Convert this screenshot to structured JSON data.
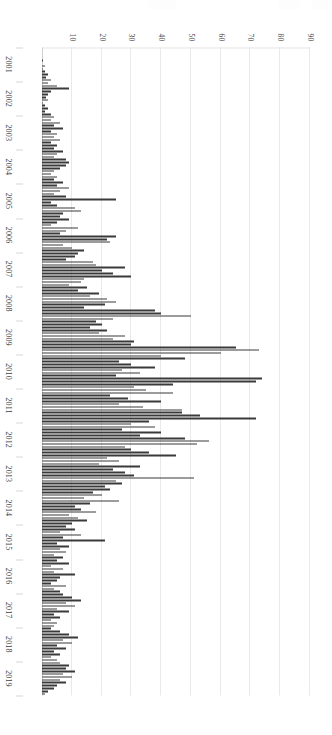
{
  "figure": {
    "orientation": "rotated-90-clockwise-on-page",
    "background_color": "#ffffff",
    "bar_color": "#3a3a3a",
    "gridline_color": "#e9e9e9",
    "axis_color": "#cfcfcf"
  },
  "chart_data": {
    "type": "bar",
    "title": "",
    "subtitle": "",
    "xlabel": "",
    "ylabel": "",
    "xlim_categories": [
      "2001",
      "2019"
    ],
    "ylim": [
      0,
      90
    ],
    "grid": true,
    "legend": null,
    "legend_position": "none",
    "y_ticks": [
      10,
      20,
      30,
      40,
      50,
      60,
      70,
      80,
      90
    ],
    "y_tick_labels": [
      "10",
      "20",
      "30",
      "40",
      "50",
      "60",
      "70",
      "80",
      "90"
    ],
    "x_tick_labels": [
      "2001",
      "2002",
      "2003",
      "2004",
      "2005",
      "2006",
      "2007",
      "2008",
      "2009",
      "2010",
      "2011",
      "2012",
      "2013",
      "2014",
      "2015",
      "2016",
      "2017",
      "2018",
      "2019"
    ],
    "bar_interval": "monthly",
    "categories": [
      "2001-01",
      "2001-02",
      "2001-03",
      "2001-04",
      "2001-05",
      "2001-06",
      "2001-07",
      "2001-08",
      "2001-09",
      "2001-10",
      "2001-11",
      "2001-12",
      "2002-01",
      "2002-02",
      "2002-03",
      "2002-04",
      "2002-05",
      "2002-06",
      "2002-07",
      "2002-08",
      "2002-09",
      "2002-10",
      "2002-11",
      "2002-12",
      "2003-01",
      "2003-02",
      "2003-03",
      "2003-04",
      "2003-05",
      "2003-06",
      "2003-07",
      "2003-08",
      "2003-09",
      "2003-10",
      "2003-11",
      "2003-12",
      "2004-01",
      "2004-02",
      "2004-03",
      "2004-04",
      "2004-05",
      "2004-06",
      "2004-07",
      "2004-08",
      "2004-09",
      "2004-10",
      "2004-11",
      "2004-12",
      "2005-01",
      "2005-02",
      "2005-03",
      "2005-04",
      "2005-05",
      "2005-06",
      "2005-07",
      "2005-08",
      "2005-09",
      "2005-10",
      "2005-11",
      "2005-12",
      "2006-01",
      "2006-02",
      "2006-03",
      "2006-04",
      "2006-05",
      "2006-06",
      "2006-07",
      "2006-08",
      "2006-09",
      "2006-10",
      "2006-11",
      "2006-12",
      "2007-01",
      "2007-02",
      "2007-03",
      "2007-04",
      "2007-05",
      "2007-06",
      "2007-07",
      "2007-08",
      "2007-09",
      "2007-10",
      "2007-11",
      "2007-12",
      "2008-01",
      "2008-02",
      "2008-03",
      "2008-04",
      "2008-05",
      "2008-06",
      "2008-07",
      "2008-08",
      "2008-09",
      "2008-10",
      "2008-11",
      "2008-12",
      "2009-01",
      "2009-02",
      "2009-03",
      "2009-04",
      "2009-05",
      "2009-06",
      "2009-07",
      "2009-08",
      "2009-09",
      "2009-10",
      "2009-11",
      "2009-12",
      "2010-01",
      "2010-02",
      "2010-03",
      "2010-04",
      "2010-05",
      "2010-06",
      "2010-07",
      "2010-08",
      "2010-09",
      "2010-10",
      "2010-11",
      "2010-12",
      "2011-01",
      "2011-02",
      "2011-03",
      "2011-04",
      "2011-05",
      "2011-06",
      "2011-07",
      "2011-08",
      "2011-09",
      "2011-10",
      "2011-11",
      "2011-12",
      "2012-01",
      "2012-02",
      "2012-03",
      "2012-04",
      "2012-05",
      "2012-06",
      "2012-07",
      "2012-08",
      "2012-09",
      "2012-10",
      "2012-11",
      "2012-12",
      "2013-01",
      "2013-02",
      "2013-03",
      "2013-04",
      "2013-05",
      "2013-06",
      "2013-07",
      "2013-08",
      "2013-09",
      "2013-10",
      "2013-11",
      "2013-12",
      "2014-01",
      "2014-02",
      "2014-03",
      "2014-04",
      "2014-05",
      "2014-06",
      "2014-07",
      "2014-08",
      "2014-09",
      "2014-10",
      "2014-11",
      "2014-12",
      "2015-01",
      "2015-02",
      "2015-03",
      "2015-04",
      "2015-05",
      "2015-06",
      "2015-07",
      "2015-08",
      "2015-09",
      "2015-10",
      "2015-11",
      "2015-12",
      "2016-01",
      "2016-02",
      "2016-03",
      "2016-04",
      "2016-05",
      "2016-06",
      "2016-07",
      "2016-08",
      "2016-09",
      "2016-10",
      "2016-11",
      "2016-12",
      "2017-01",
      "2017-02",
      "2017-03",
      "2017-04",
      "2017-05",
      "2017-06",
      "2017-07",
      "2017-08",
      "2017-09",
      "2017-10",
      "2017-11",
      "2017-12",
      "2018-01",
      "2018-02",
      "2018-03",
      "2018-04",
      "2018-05",
      "2018-06",
      "2018-07",
      "2018-08",
      "2018-09",
      "2018-10",
      "2018-11",
      "2018-12",
      "2019-01",
      "2019-02",
      "2019-03",
      "2019-04",
      "2019-05",
      "2019-06",
      "2019-07",
      "2019-08",
      "2019-09",
      "2019-10",
      "2019-11",
      "2019-12"
    ],
    "values": [
      0,
      0,
      0,
      0,
      0.5,
      0,
      1,
      0.5,
      1,
      2,
      1.5,
      3,
      2,
      5,
      9,
      3,
      2,
      1.5,
      2,
      0.5,
      1,
      2,
      1,
      3,
      4,
      3,
      6,
      4,
      7,
      3,
      5,
      4,
      6,
      3,
      5,
      4,
      7,
      5,
      4,
      8,
      9,
      8,
      6,
      4,
      3,
      5,
      4,
      7,
      5,
      9,
      6,
      4,
      8,
      25,
      3,
      5,
      11,
      13,
      7,
      6,
      9,
      5,
      3,
      12,
      8,
      6,
      25,
      22,
      23,
      7,
      10,
      14,
      12,
      11,
      8,
      17,
      18,
      28,
      20,
      24,
      30,
      14,
      13,
      9,
      15,
      12,
      19,
      16,
      22,
      25,
      21,
      14,
      38,
      40,
      50,
      24,
      18,
      20,
      16,
      22,
      19,
      28,
      24,
      31,
      30,
      65,
      73,
      60,
      40,
      48,
      26,
      30,
      38,
      27,
      33,
      25,
      74,
      72,
      44,
      31,
      35,
      44,
      23,
      29,
      40,
      26,
      34,
      47,
      47,
      53,
      72,
      36,
      30,
      38,
      27,
      40,
      33,
      48,
      56,
      52,
      28,
      30,
      36,
      45,
      22,
      26,
      19,
      33,
      24,
      28,
      31,
      51,
      25,
      27,
      21,
      23,
      17,
      20,
      14,
      26,
      16,
      11,
      13,
      18,
      9,
      12,
      15,
      10,
      8,
      11,
      6,
      13,
      7,
      21,
      5,
      9,
      6,
      8,
      4,
      7,
      5,
      9,
      3,
      7,
      4,
      11,
      6,
      5,
      3,
      8,
      4,
      6,
      7,
      10,
      13,
      8,
      11,
      5,
      9,
      4,
      6,
      3,
      5,
      4,
      3,
      6,
      9,
      12,
      7,
      10,
      5,
      8,
      4,
      6,
      3,
      5,
      6,
      9,
      8,
      11,
      7,
      10,
      6,
      8,
      5,
      4,
      2,
      1
    ]
  }
}
